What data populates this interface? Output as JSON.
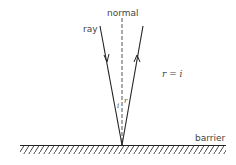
{
  "labels": {
    "normal": "normal",
    "ray": "ray",
    "equation": "r = i",
    "angle_i": "i",
    "angle_r": "r",
    "barrier": "barrier"
  },
  "colors": {
    "line": "#222222",
    "text": "#444444"
  }
}
